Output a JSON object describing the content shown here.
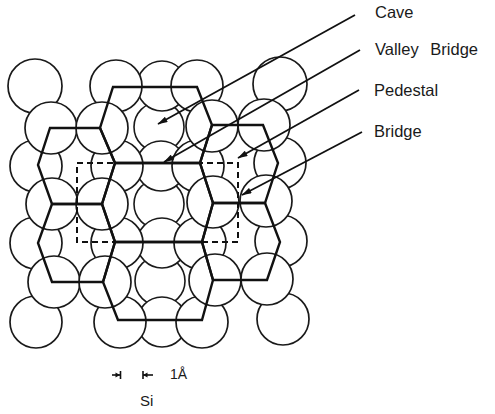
{
  "figure": {
    "sites": [
      {
        "label": "Cave"
      },
      {
        "label": "Valley Bridge"
      },
      {
        "label": "Pedestal"
      },
      {
        "label": "Bridge"
      }
    ],
    "scale_bar": {
      "label": "1Å"
    },
    "substrate_label": "Si"
  },
  "colors": {
    "ink": "#1a1a1a",
    "background": "#ffffff"
  }
}
